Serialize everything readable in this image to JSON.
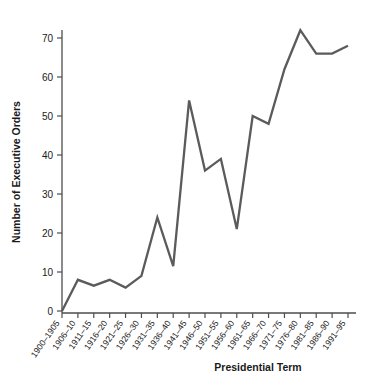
{
  "chart_data": {
    "type": "line",
    "title": "",
    "xlabel": "Presidential Term",
    "ylabel": "Number of Executive Orders",
    "categories": [
      "1900–1905",
      "1906–10",
      "1911–15",
      "1916–20",
      "1921–25",
      "1926–30",
      "1931–35",
      "1936–40",
      "1941–45",
      "1946–50",
      "1951–55",
      "1956–60",
      "1961–65",
      "1966–70",
      "1971–75",
      "1976–80",
      "1981–85",
      "1986–90",
      "1991–95"
    ],
    "values": [
      0,
      8,
      6.5,
      8,
      6,
      9,
      24,
      11.5,
      54,
      36,
      39,
      21,
      50,
      48,
      62,
      72,
      66,
      66,
      68
    ],
    "yticks": [
      0,
      10,
      20,
      30,
      40,
      50,
      60,
      70
    ],
    "ylim": [
      0,
      74
    ],
    "grid": false,
    "legend": "none",
    "line_color": "#5b5b5b",
    "axis_color": "#4d4d4d"
  }
}
